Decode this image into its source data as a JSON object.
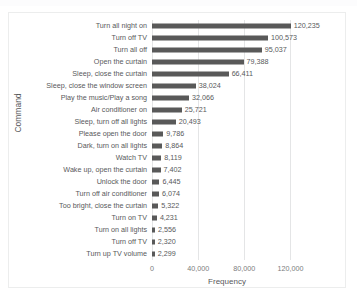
{
  "chart_data": {
    "type": "bar",
    "orientation": "horizontal",
    "title": "",
    "xlabel": "Frequency",
    "ylabel": "Command",
    "xlim": [
      0,
      130000
    ],
    "xticks": [
      "0",
      "40,000",
      "80,000",
      "120,000"
    ],
    "xtick_values": [
      0,
      40000,
      80000,
      120000
    ],
    "grid": true,
    "legend": false,
    "bar_color": "#595959",
    "gridline_color": "#E4E5E6",
    "text_color": "#58595B",
    "categories": [
      "Turn all night on",
      "Turn off TV",
      "Turn all off",
      "Open the curtain",
      "Sleep, close the curtain",
      "Sleep, close the window screen",
      "Play the music/Play a song",
      "Air conditioner on",
      "Sleep, turn off all lights",
      "Please open the door",
      "Dark, turn on all lights",
      "Watch TV",
      "Wake up, open the curtain",
      "Unlock the door",
      "Turn off air conditioner",
      "Too bright, close the curtain",
      "Turn on TV",
      "Turn on all lights",
      "Turn off TV",
      "Turn up TV volume"
    ],
    "values": [
      120235,
      100573,
      95037,
      79388,
      66411,
      38024,
      32066,
      25721,
      20493,
      9786,
      8864,
      8119,
      7402,
      6445,
      6074,
      5322,
      4231,
      2556,
      2320,
      2299
    ],
    "value_labels": [
      "120,235",
      "100,573",
      "95,037",
      "79,388",
      "66,411",
      "38,024",
      "32,066",
      "25,721",
      "20,493",
      "9,786",
      "8,864",
      "8,119",
      "7,402",
      "6,445",
      "6,074",
      "5,322",
      "4,231",
      "2,556",
      "2,320",
      "2,299"
    ]
  }
}
